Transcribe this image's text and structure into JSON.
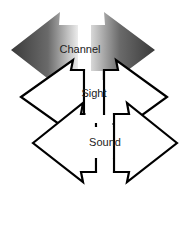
{
  "diagram": {
    "type": "stacked double-headed arrows",
    "layers": [
      {
        "id": "channel",
        "label": "Channel",
        "style": "gradient-fill",
        "fill_dark": "#3a3a3a",
        "fill_light": "#e6e6e6"
      },
      {
        "id": "sight",
        "label": "Sight",
        "style": "outline",
        "stroke": "#000000",
        "fill": "#ffffff"
      },
      {
        "id": "sound",
        "label": "Sound",
        "style": "outline",
        "stroke": "#000000",
        "fill": "#ffffff"
      }
    ]
  }
}
